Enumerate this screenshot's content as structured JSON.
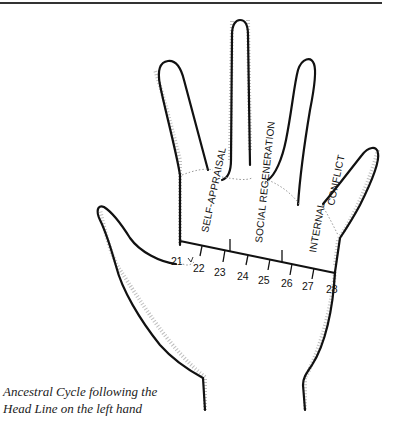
{
  "figure": {
    "regions": {
      "self_appraisal": "SELF-APPRAISAL",
      "social_regeneration": "SOCIAL REGENERATION",
      "internal": "INTERNAL",
      "conflict": "CONFLICT"
    },
    "age_marks": [
      "21",
      "22",
      "23",
      "24",
      "25",
      "26",
      "27",
      "28"
    ],
    "caption_line1": "Ancestral Cycle following the",
    "caption_line2": "Head Line on the left hand"
  }
}
